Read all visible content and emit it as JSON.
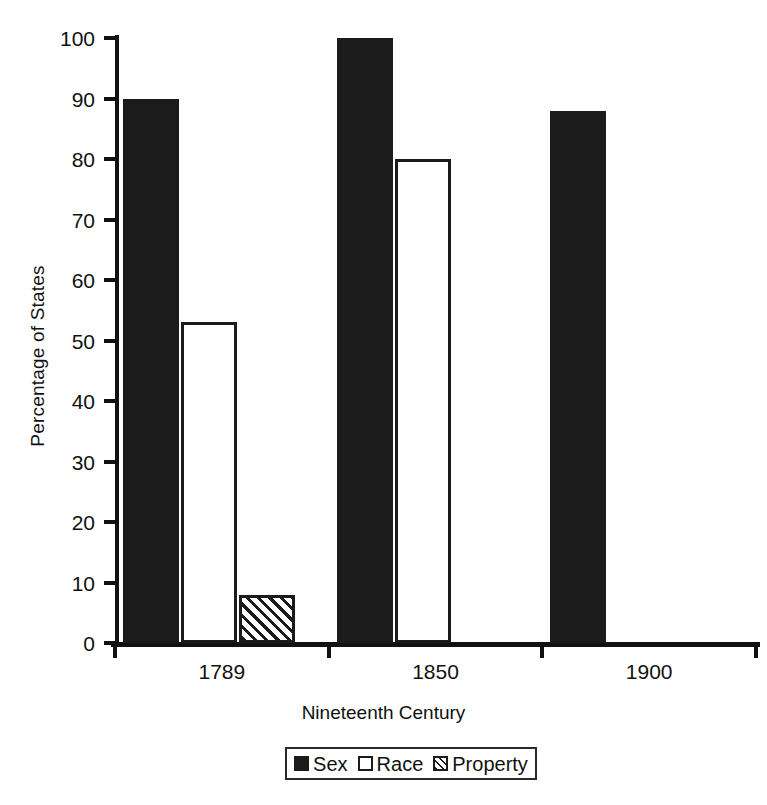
{
  "chart_data": {
    "type": "bar",
    "title": "",
    "subtitle": "",
    "xlabel": "Nineteenth Century",
    "ylabel": "Percentage of States",
    "categories": [
      "1789",
      "1850",
      "1900"
    ],
    "series": [
      {
        "name": "Sex",
        "values": [
          90,
          100,
          88
        ],
        "style": "solid-black",
        "color": "#1c1b1b"
      },
      {
        "name": "Race",
        "values": [
          53,
          80,
          0
        ],
        "style": "open-white",
        "color": "#ffffff"
      },
      {
        "name": "Property",
        "values": [
          8,
          0,
          0
        ],
        "style": "diagonal-hatch",
        "color": "#1c1b1b"
      }
    ],
    "ylim": [
      0,
      100
    ],
    "ytick_values": [
      0,
      10,
      20,
      30,
      40,
      50,
      60,
      70,
      80,
      90,
      100
    ],
    "ytick_labels": [
      "0",
      "10",
      "20",
      "30",
      "40",
      "50",
      "60",
      "70",
      "80",
      "90",
      "100"
    ],
    "grid": false,
    "legend_position": "bottom-center",
    "legend_entries": [
      "Sex",
      "Race",
      "Property"
    ],
    "background_color": "#ffffff",
    "axis_color": "#111111"
  },
  "axes": {
    "y_title": "Percentage of States",
    "x_title": "Nineteenth Century"
  },
  "legend": {
    "items": [
      {
        "label": "Sex"
      },
      {
        "label": "Race"
      },
      {
        "label": "Property"
      }
    ]
  }
}
